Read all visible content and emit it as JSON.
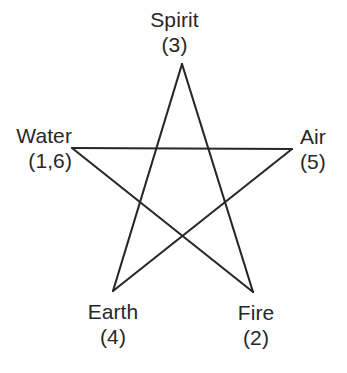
{
  "diagram": {
    "type": "pentagram",
    "background_color": "#ffffff",
    "stroke_color": "#272727",
    "stroke_width": 2.1,
    "text_color": "#272727",
    "canvas": {
      "width": 347,
      "height": 373
    },
    "vertices": [
      {
        "id": "spirit",
        "name": "Spirit",
        "number": "(3)",
        "position": "top",
        "x": 182,
        "y": 64
      },
      {
        "id": "water",
        "name": "Water",
        "number": "(1,6)",
        "position": "left",
        "x": 72,
        "y": 148
      },
      {
        "id": "air",
        "name": "Air",
        "number": "(5)",
        "position": "right",
        "x": 292,
        "y": 149
      },
      {
        "id": "earth",
        "name": "Earth",
        "number": "(4)",
        "position": "bottom-left",
        "x": 113,
        "y": 291
      },
      {
        "id": "fire",
        "name": "Fire",
        "number": "(2)",
        "position": "bottom-right",
        "x": 253,
        "y": 292
      }
    ],
    "edges": [
      {
        "id": "edge-spirit-fire",
        "from": "spirit",
        "to": "fire"
      },
      {
        "id": "edge-fire-water",
        "from": "fire",
        "to": "water"
      },
      {
        "id": "edge-water-air",
        "from": "water",
        "to": "air"
      },
      {
        "id": "edge-air-earth",
        "from": "air",
        "to": "earth"
      },
      {
        "id": "edge-earth-spirit",
        "from": "earth",
        "to": "spirit"
      }
    ]
  }
}
